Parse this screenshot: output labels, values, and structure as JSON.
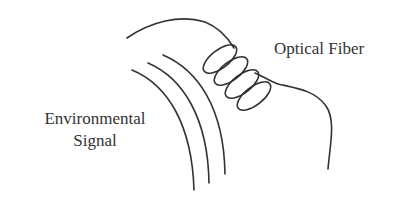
{
  "diagram": {
    "labels": {
      "optical_fiber": "Optical Fiber",
      "environmental_line1": "Environmental",
      "environmental_line2": "Signal"
    },
    "elements": {
      "fiber": "optical fiber curve wrapping over arcs with coiled section",
      "coil_loops": 4,
      "signal_arcs": 3
    },
    "colors": {
      "stroke": "#333333",
      "background": "#ffffff"
    }
  }
}
